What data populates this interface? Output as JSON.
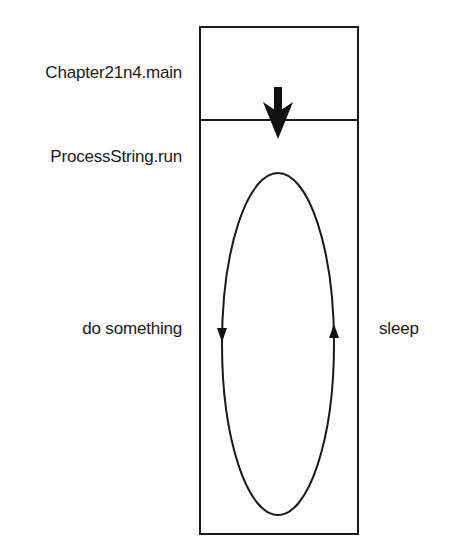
{
  "diagram": {
    "type": "thread-call-stack",
    "labels": {
      "main_method": "Chapter21n4.main",
      "run_method": "ProcessString.run",
      "loop_left": "do something",
      "loop_right": "sleep"
    },
    "colors": {
      "stroke": "#1a1a1a",
      "background": "#ffffff"
    },
    "shapes": {
      "outer_box": {
        "x": 200,
        "y": 27,
        "width": 158,
        "height": 507
      },
      "divider_y": 120,
      "call_arrow": {
        "cx": 278,
        "shaft_top": 87,
        "tip_y": 139,
        "direction": "down"
      },
      "loop_ellipse": {
        "cx": 278,
        "cy": 344,
        "rx": 56,
        "ry": 171
      },
      "loop_arrows": [
        {
          "side": "left",
          "x": 222,
          "y": 336,
          "direction": "down"
        },
        {
          "side": "right",
          "x": 334,
          "y": 330,
          "direction": "up"
        }
      ]
    }
  }
}
